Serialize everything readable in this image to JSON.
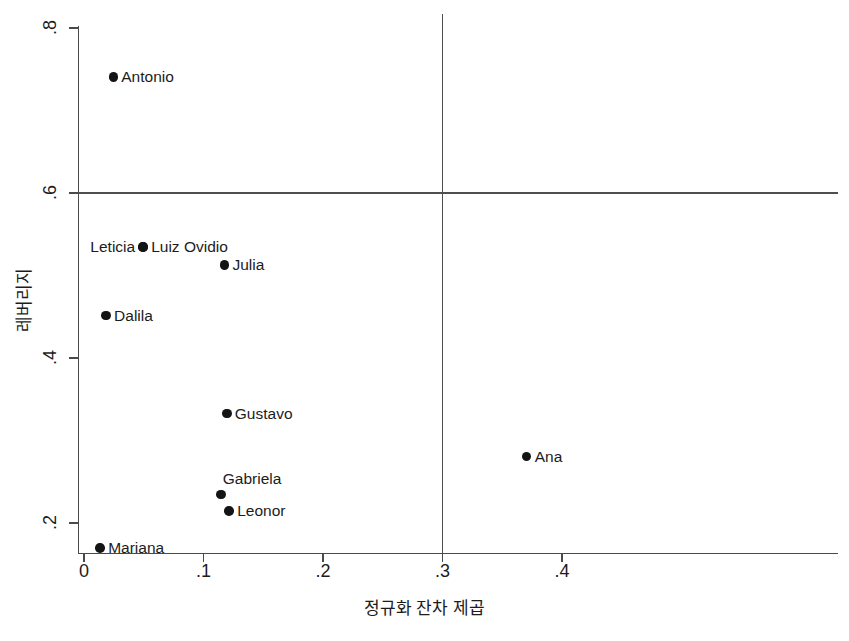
{
  "chart_data": {
    "type": "scatter",
    "title": "",
    "xlabel": "정규화 잔차 제곱",
    "ylabel": "레버리지",
    "xlim": [
      -0.018,
      0.418
    ],
    "ylim": [
      0.13,
      0.815
    ],
    "xticks": [
      0,
      0.1,
      0.2,
      0.3,
      0.4
    ],
    "xtick_labels": [
      "0",
      ".1",
      ".2",
      ".3",
      ".4"
    ],
    "yticks": [
      0.2,
      0.4,
      0.6,
      0.8
    ],
    "ytick_labels": [
      ".2",
      ".4",
      ".6",
      ".8"
    ],
    "grid": false,
    "legend": null,
    "reference_lines": [
      {
        "name": "leverage-threshold",
        "orientation": "horizontal",
        "value": 0.6
      },
      {
        "name": "residual-threshold",
        "orientation": "vertical",
        "value": 0.3
      }
    ],
    "marker_color": "#141414",
    "axis_color": "#4a4a4a",
    "points": [
      {
        "label": "Antonio",
        "x": 0.0245,
        "y": 0.7405,
        "label_pos": "right"
      },
      {
        "label": "Leticia",
        "x": 0.0495,
        "y": 0.5345,
        "label_pos": "left"
      },
      {
        "label": "Luiz Ovidio",
        "x": 0.0495,
        "y": 0.5345,
        "label_pos": "right"
      },
      {
        "label": "Julia",
        "x": 0.1175,
        "y": 0.5125,
        "label_pos": "right"
      },
      {
        "label": "Dalila",
        "x": 0.0185,
        "y": 0.4515,
        "label_pos": "right"
      },
      {
        "label": "Gustavo",
        "x": 0.1195,
        "y": 0.3325,
        "label_pos": "right"
      },
      {
        "label": "Ana",
        "x": 0.3705,
        "y": 0.2805,
        "label_pos": "right"
      },
      {
        "label": "Gabriela",
        "x": 0.1145,
        "y": 0.2345,
        "label_pos": "above"
      },
      {
        "label": "Leonor",
        "x": 0.1215,
        "y": 0.2145,
        "label_pos": "right"
      },
      {
        "label": "Mariana",
        "x": 0.0135,
        "y": 0.1695,
        "label_pos": "right"
      }
    ]
  }
}
